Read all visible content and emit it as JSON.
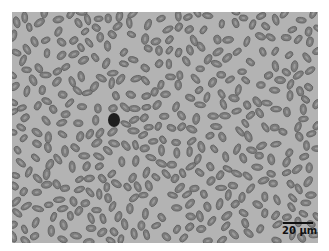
{
  "image": {
    "subject": "blood smear micrograph with oval cells",
    "background_color": "#b3b3b3",
    "cell_fill": "#7d7d7d",
    "cell_center": "#9a9a9a",
    "cell_edge": "#5e5e5e",
    "dark_cell": {
      "x": 114,
      "y": 120,
      "rx": 6,
      "ry": 7,
      "color": "#1e1e1e"
    },
    "cell_count_approx": 420
  },
  "scale_bar": {
    "label": "20 µm"
  }
}
